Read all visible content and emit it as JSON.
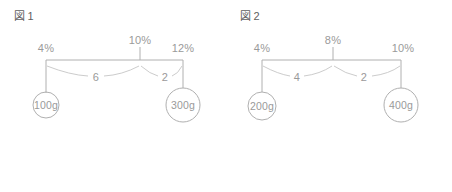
{
  "figures": [
    {
      "caption_mark": "図",
      "caption_number": "1",
      "left_pct": "4%",
      "fulcrum_pct": "10%",
      "right_pct": "12%",
      "left_distance": "6",
      "right_distance": "2",
      "left_mass": "100g",
      "right_mass": "300g"
    },
    {
      "caption_mark": "図",
      "caption_number": "2",
      "left_pct": "4%",
      "fulcrum_pct": "8%",
      "right_pct": "10%",
      "left_distance": "4",
      "right_distance": "2",
      "left_mass": "200g",
      "right_mass": "400g"
    }
  ],
  "answer": {
    "label": "正 解",
    "caret": "▶",
    "value": "1"
  },
  "colors": {
    "line": "#b0b0b0",
    "text": "#9a9a9a",
    "caption_text": "#5f5f5f",
    "button_border": "#9d9d9d",
    "button_text": "#3c3c3c",
    "background": "#ffffff"
  }
}
